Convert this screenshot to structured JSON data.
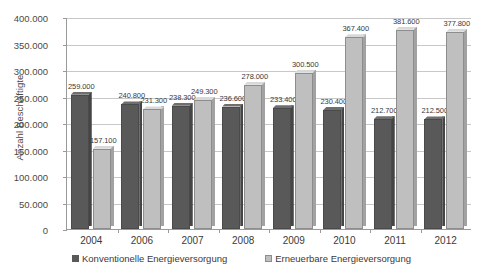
{
  "chart_data": {
    "type": "bar",
    "title": "",
    "xlabel": "",
    "ylabel": "Anzahl Beschäftigte",
    "categories": [
      "2004",
      "2006",
      "2007",
      "2008",
      "2009",
      "2010",
      "2011",
      "2012"
    ],
    "series": [
      {
        "name": "Konventionelle Energieversorgung",
        "color": "#595959",
        "values": [
          259000,
          240800,
          238300,
          236600,
          233400,
          230400,
          212700,
          212500
        ],
        "labels": [
          "259.000",
          "240.800",
          "238.300",
          "236.600",
          "233.400",
          "230.400",
          "212.700",
          "212.500"
        ]
      },
      {
        "name": "Erneuerbare Energieversorgung",
        "color": "#bfbfbf",
        "values": [
          157100,
          231300,
          249300,
          278000,
          300500,
          367400,
          381600,
          377800
        ],
        "labels": [
          "157.100",
          "231.300",
          "249.300",
          "278.000",
          "300.500",
          "367.400",
          "381.600",
          "377.800"
        ]
      }
    ],
    "ylim": [
      0,
      400000
    ],
    "ytick_values": [
      0,
      50000,
      100000,
      150000,
      200000,
      250000,
      300000,
      350000,
      400000
    ],
    "ytick_labels": [
      "0",
      "50.000",
      "100.000",
      "150.000",
      "200.000",
      "250.000",
      "300.000",
      "350.000",
      "400.000"
    ],
    "grid": true,
    "legend_position": "bottom",
    "data_labels": true
  },
  "legend": {
    "items": [
      {
        "label": "Konventionelle Energieversorgung",
        "marker": "square-marker-dark"
      },
      {
        "label": "Erneuerbare Energieversorgung",
        "marker": "square-marker-light"
      }
    ]
  }
}
